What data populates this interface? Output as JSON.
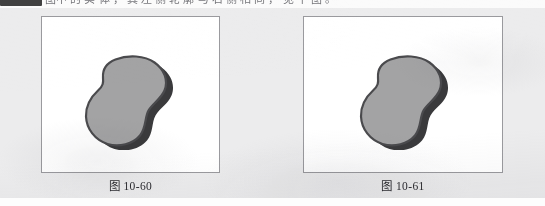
{
  "page": {
    "background_color": "#ececed",
    "paper_type": "scanned-textbook-page",
    "top_partial_line": {
      "redacted_fragment": "█████",
      "faint_text": "图中 的 实 体 ， 其 左 侧 轮 廓 与 右 侧 相 同 ， 见 下 图 。"
    },
    "bottom_strip_color": "#fdfdfd"
  },
  "figures": [
    {
      "id": "figure-10-60",
      "caption": "图 10-60",
      "panel": {
        "border_color": "#9a9a9e",
        "background_color": "#ffffff",
        "width": 179,
        "height": 157
      },
      "shape": {
        "name": "gourd-blob",
        "description": "peanut / gourd shaped closed outline with drop shadow",
        "fill_color": "#a3a3a4",
        "outline_color": "#4a4a4d",
        "shadow_color": "#3a3a3c",
        "shadow_offset_x": 7,
        "shadow_offset_y": 5
      }
    },
    {
      "id": "figure-10-61",
      "caption": "图 10-61",
      "panel": {
        "border_color": "#9a9a9e",
        "background_color": "#ffffff",
        "width": 200,
        "height": 157
      },
      "shape": {
        "name": "gourd-blob",
        "description": "peanut / gourd shaped closed outline with drop shadow",
        "fill_color": "#a3a3a4",
        "outline_color": "#4a4a4d",
        "shadow_color": "#3a3a3c",
        "shadow_offset_x": 7,
        "shadow_offset_y": 5
      }
    }
  ]
}
